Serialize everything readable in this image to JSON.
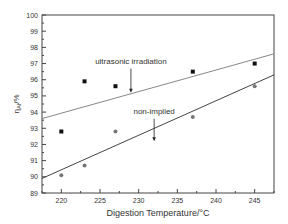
{
  "chart_data": {
    "type": "scatter",
    "title": "",
    "xlabel": "Digestion Temperature/°C",
    "ylabel": "η_Al/%",
    "ylabel_main": "η",
    "ylabel_sub": "Al",
    "ylabel_tail": "/%",
    "xlim": [
      217.5,
      247.5
    ],
    "ylim": [
      89,
      100
    ],
    "x_ticks": [
      220,
      225,
      230,
      235,
      240,
      245
    ],
    "x_tick_labels": [
      "220",
      "225",
      "230",
      "235",
      "240",
      "245"
    ],
    "y_ticks": [
      89,
      90,
      91,
      92,
      93,
      94,
      95,
      96,
      97,
      98,
      99,
      100
    ],
    "y_tick_labels": [
      "89",
      "90",
      "91",
      "92",
      "93",
      "94",
      "95",
      "96",
      "97",
      "98",
      "99",
      "100"
    ],
    "grid": false,
    "legend": "none (inline annotations with arrows)",
    "series": [
      {
        "name": "ultrasonic irradiation",
        "marker": "square",
        "color": "#111111",
        "x": [
          220,
          223,
          227,
          237,
          245
        ],
        "values": [
          92.8,
          95.9,
          95.6,
          96.5,
          97.0
        ],
        "fit_line": {
          "x": [
            217.5,
            247.5
          ],
          "y": [
            93.6,
            97.6
          ],
          "color": "#888888"
        }
      },
      {
        "name": "non-implied",
        "marker": "circle",
        "color": "#777777",
        "x": [
          220,
          223,
          227,
          237,
          245
        ],
        "values": [
          90.1,
          90.7,
          92.8,
          93.7,
          95.6
        ],
        "fit_line": {
          "x": [
            217.5,
            247.5
          ],
          "y": [
            89.9,
            96.3
          ],
          "color": "#444444"
        }
      }
    ],
    "annotations": [
      {
        "text": "ultrasonic irradiation",
        "x": 229,
        "y": 97.0,
        "arrow_to": {
          "x": 229,
          "y": 95.2
        }
      },
      {
        "text": "non-implied",
        "x": 232,
        "y": 93.9,
        "arrow_to": {
          "x": 232,
          "y": 92.2
        }
      }
    ]
  }
}
